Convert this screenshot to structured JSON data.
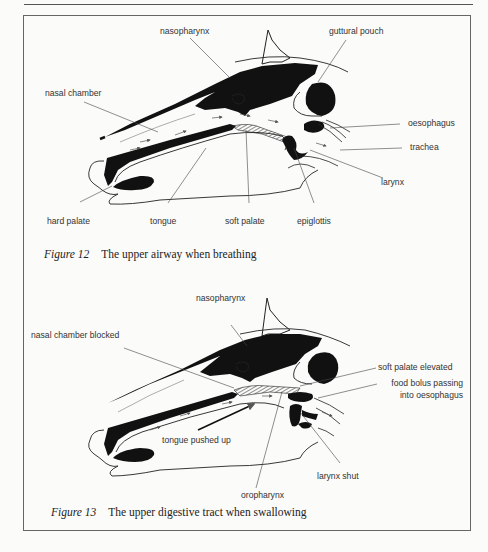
{
  "figures": [
    {
      "number": "Figure 12",
      "caption": "The upper airway when breathing",
      "labels": {
        "nasopharynx": "nasopharynx",
        "guttural_pouch": "guttural pouch",
        "nasal_chamber": "nasal chamber",
        "oesophagus": "oesophagus",
        "trachea": "trachea",
        "larynx": "larynx",
        "hard_palate": "hard palate",
        "tongue": "tongue",
        "soft_palate": "soft palate",
        "epiglottis": "epiglottis"
      }
    },
    {
      "number": "Figure 13",
      "caption": "The upper digestive tract when swallowing",
      "labels": {
        "nasopharynx": "nasopharynx",
        "nasal_chamber_blocked": "nasal chamber blocked",
        "soft_palate_elevated": "soft palate elevated",
        "food_bolus_line1": "food bolus passing",
        "food_bolus_line2": "into oesophagus",
        "tongue_pushed_up": "tongue pushed up",
        "larynx_shut": "larynx shut",
        "oropharynx": "oropharynx"
      }
    }
  ],
  "colors": {
    "ink": "#111111",
    "line": "#444444",
    "page": "#fbfbf9"
  }
}
